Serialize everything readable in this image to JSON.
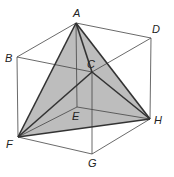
{
  "colors": {
    "face_fill": "#bdbdbd",
    "edge": "#333333",
    "cube_edge": "#444444"
  },
  "vertices": {
    "A": {
      "x": 76,
      "y": 23,
      "label": "A",
      "lx": 73,
      "ly": 17
    },
    "B": {
      "x": 17,
      "y": 57,
      "label": "B",
      "lx": 5,
      "ly": 62
    },
    "C": {
      "x": 92,
      "y": 72,
      "label": "C",
      "lx": 87,
      "ly": 68
    },
    "D": {
      "x": 151,
      "y": 38,
      "label": "D",
      "lx": 152,
      "ly": 33
    },
    "E": {
      "x": 77,
      "y": 107,
      "label": "E",
      "lx": 72,
      "ly": 120
    },
    "F": {
      "x": 18,
      "y": 137,
      "label": "F",
      "lx": 6,
      "ly": 148
    },
    "G": {
      "x": 92,
      "y": 154,
      "label": "G",
      "lx": 88,
      "ly": 167
    },
    "H": {
      "x": 150,
      "y": 119,
      "label": "H",
      "lx": 154,
      "ly": 124
    }
  },
  "cube_edges": [
    [
      "A",
      "B"
    ],
    [
      "A",
      "D"
    ],
    [
      "B",
      "C"
    ],
    [
      "C",
      "D"
    ],
    [
      "A",
      "E"
    ],
    [
      "B",
      "F"
    ],
    [
      "C",
      "G"
    ],
    [
      "D",
      "H"
    ],
    [
      "E",
      "F"
    ],
    [
      "E",
      "H"
    ],
    [
      "F",
      "G"
    ],
    [
      "G",
      "H"
    ]
  ],
  "tetrahedron_edges": [
    [
      "A",
      "C"
    ],
    [
      "A",
      "F"
    ],
    [
      "A",
      "H"
    ],
    [
      "C",
      "F"
    ],
    [
      "C",
      "H"
    ],
    [
      "F",
      "H"
    ]
  ]
}
